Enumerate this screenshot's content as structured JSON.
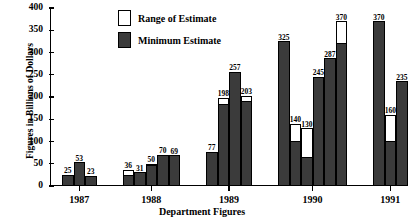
{
  "chart_data": {
    "type": "bar",
    "title": "",
    "xlabel": "Department Figures",
    "ylabel": "Figures in Billions of Dollars",
    "ylim": [
      0,
      400
    ],
    "yticks": [
      0,
      50,
      100,
      150,
      200,
      250,
      300,
      350,
      400
    ],
    "grid": false,
    "legend_position": "top-center",
    "legend": [
      {
        "label": "Range of Estimate",
        "swatch": "white-outlined"
      },
      {
        "label": "Minimum Estimate",
        "swatch": "dark-filled"
      }
    ],
    "categories": [
      "1987",
      "1988",
      "1989",
      "1990",
      "1991"
    ],
    "groups": [
      {
        "category": "1987",
        "bars": [
          {
            "label": "25",
            "total": 25,
            "minimum": 25,
            "range_top": 25
          },
          {
            "label": "53",
            "total": 53,
            "minimum": 53,
            "range_top": 53
          },
          {
            "label": "23",
            "total": 23,
            "minimum": 23,
            "range_top": 23
          }
        ]
      },
      {
        "category": "1988",
        "bars": [
          {
            "label": "36",
            "total": 36,
            "minimum": 22,
            "range_top": 36
          },
          {
            "label": "31",
            "total": 31,
            "minimum": 31,
            "range_top": 31
          },
          {
            "label": "50",
            "total": 50,
            "minimum": 44,
            "range_top": 50
          },
          {
            "label": "70",
            "total": 70,
            "minimum": 70,
            "range_top": 70
          },
          {
            "label": "69",
            "total": 69,
            "minimum": 69,
            "range_top": 69
          }
        ]
      },
      {
        "category": "1989",
        "bars": [
          {
            "label": "77",
            "total": 77,
            "minimum": 77,
            "range_top": 77
          },
          {
            "label": "198",
            "total": 198,
            "minimum": 183,
            "range_top": 198
          },
          {
            "label": "257",
            "total": 257,
            "minimum": 257,
            "range_top": 257
          },
          {
            "label": "203",
            "total": 203,
            "minimum": 188,
            "range_top": 203
          }
        ]
      },
      {
        "category": "1990",
        "bars": [
          {
            "label": "325",
            "total": 325,
            "minimum": 325,
            "range_top": 325
          },
          {
            "label": "140",
            "total": 140,
            "minimum": 98,
            "range_top": 140
          },
          {
            "label": "130",
            "total": 130,
            "minimum": 62,
            "range_top": 130
          },
          {
            "label": "245",
            "total": 245,
            "minimum": 245,
            "range_top": 245
          },
          {
            "label": "287",
            "total": 287,
            "minimum": 287,
            "range_top": 287
          },
          {
            "label": "370",
            "total": 370,
            "minimum": 318,
            "range_top": 370
          }
        ]
      },
      {
        "category": "1991",
        "bars": [
          {
            "label": "370",
            "total": 370,
            "minimum": 370,
            "range_top": 370
          },
          {
            "label": "160",
            "total": 160,
            "minimum": 100,
            "range_top": 160
          },
          {
            "label": "235",
            "total": 235,
            "minimum": 235,
            "range_top": 235
          }
        ]
      }
    ],
    "colors": {
      "minimum_estimate": "#3b3b3b",
      "range_of_estimate": "#ffffff",
      "axis": "#000000",
      "background": "#ffffff"
    }
  }
}
